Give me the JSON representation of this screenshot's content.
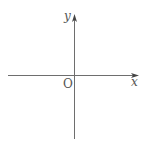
{
  "diagram": {
    "type": "cartesian-axes",
    "x_axis": {
      "label": "x"
    },
    "y_axis": {
      "label": "y"
    },
    "origin": {
      "label": "O"
    },
    "colors": {
      "axis": "#6e6e6e",
      "label": "#555555",
      "background": "#ffffff"
    }
  }
}
